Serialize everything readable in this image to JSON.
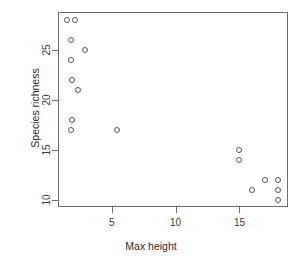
{
  "chart_data": {
    "type": "scatter",
    "title": "",
    "xlabel": "Max height",
    "ylabel": "Species richness",
    "xlim": [
      0.8,
      18.8
    ],
    "ylim": [
      9.3,
      28.8
    ],
    "xticks": [
      5,
      10,
      15
    ],
    "yticks": [
      10,
      15,
      20,
      25
    ],
    "xticklabels": [
      "5",
      "10",
      "15"
    ],
    "yticklabels": [
      "10",
      "15",
      "20",
      "25"
    ],
    "grid": false,
    "legend": null,
    "marker": "open-circle",
    "marker_color": "#555555",
    "points": [
      {
        "x": 1.5,
        "y": 28
      },
      {
        "x": 2.1,
        "y": 28
      },
      {
        "x": 1.8,
        "y": 26
      },
      {
        "x": 2.9,
        "y": 25
      },
      {
        "x": 1.8,
        "y": 24
      },
      {
        "x": 1.9,
        "y": 22
      },
      {
        "x": 2.4,
        "y": 21
      },
      {
        "x": 1.9,
        "y": 18
      },
      {
        "x": 1.8,
        "y": 17
      },
      {
        "x": 5.4,
        "y": 17
      },
      {
        "x": 15.0,
        "y": 15
      },
      {
        "x": 15.0,
        "y": 14
      },
      {
        "x": 16.0,
        "y": 11
      },
      {
        "x": 17.0,
        "y": 12
      },
      {
        "x": 18.0,
        "y": 12
      },
      {
        "x": 18.0,
        "y": 11
      },
      {
        "x": 18.0,
        "y": 10
      }
    ]
  },
  "axes": {
    "x_title": "Max height",
    "y_title": "Species richness"
  }
}
